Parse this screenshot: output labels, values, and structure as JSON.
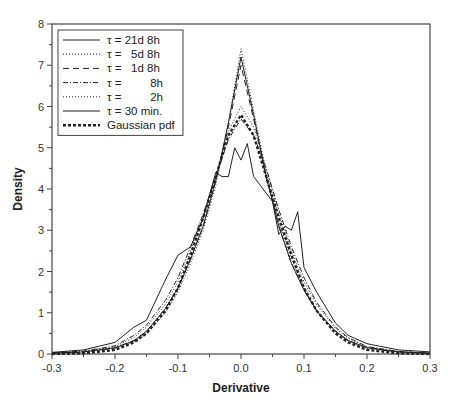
{
  "page_header": "",
  "chart_data": {
    "type": "line",
    "title": "",
    "xlabel": "Derivative",
    "ylabel": "Density",
    "xlim": [
      -0.3,
      0.3
    ],
    "ylim": [
      0,
      8
    ],
    "x_ticks": [
      "-0.3",
      "-0.2",
      "-0.1",
      "0.0",
      "0.1",
      "0.2",
      "0.3"
    ],
    "x_tick_values": [
      -0.3,
      -0.2,
      -0.1,
      0.0,
      0.1,
      0.2,
      0.3
    ],
    "y_ticks": [
      "0",
      "1",
      "2",
      "3",
      "4",
      "5",
      "6",
      "7",
      "8"
    ],
    "y_tick_values": [
      0,
      1,
      2,
      3,
      4,
      5,
      6,
      7,
      8
    ],
    "grid": false,
    "legend_position": "upper-left",
    "series": [
      {
        "name": "τ = 21d 8h",
        "style": "solid",
        "x": [
          -0.3,
          -0.25,
          -0.2,
          -0.17,
          -0.15,
          -0.12,
          -0.1,
          -0.08,
          -0.06,
          -0.04,
          -0.02,
          0.0,
          0.02,
          0.04,
          0.06,
          0.08,
          0.1,
          0.12,
          0.15,
          0.17,
          0.2,
          0.25,
          0.3
        ],
        "y": [
          0.02,
          0.05,
          0.15,
          0.32,
          0.55,
          1.1,
          1.6,
          2.3,
          3.1,
          4.2,
          5.6,
          7.2,
          5.8,
          4.3,
          3.1,
          2.2,
          1.55,
          1.05,
          0.55,
          0.33,
          0.15,
          0.05,
          0.02
        ]
      },
      {
        "name": "τ =   5d 8h",
        "style": "dotted",
        "x": [
          -0.3,
          -0.25,
          -0.2,
          -0.17,
          -0.15,
          -0.12,
          -0.1,
          -0.08,
          -0.06,
          -0.04,
          -0.02,
          0.0,
          0.02,
          0.04,
          0.06,
          0.08,
          0.1,
          0.12,
          0.15,
          0.17,
          0.2,
          0.25,
          0.3
        ],
        "y": [
          0.02,
          0.05,
          0.14,
          0.3,
          0.5,
          1.0,
          1.5,
          2.2,
          3.0,
          4.1,
          5.6,
          7.4,
          5.9,
          4.4,
          3.2,
          2.3,
          1.6,
          1.05,
          0.55,
          0.32,
          0.14,
          0.05,
          0.02
        ]
      },
      {
        "name": "τ =   1d 8h",
        "style": "dashed",
        "x": [
          -0.3,
          -0.25,
          -0.2,
          -0.17,
          -0.15,
          -0.12,
          -0.1,
          -0.08,
          -0.06,
          -0.04,
          -0.02,
          0.0,
          0.02,
          0.04,
          0.06,
          0.08,
          0.1,
          0.12,
          0.15,
          0.17,
          0.2,
          0.25,
          0.3
        ],
        "y": [
          0.02,
          0.05,
          0.15,
          0.33,
          0.55,
          1.1,
          1.6,
          2.3,
          3.1,
          4.2,
          5.5,
          7.0,
          5.7,
          4.3,
          3.1,
          2.2,
          1.55,
          1.05,
          0.55,
          0.33,
          0.15,
          0.05,
          0.02
        ]
      },
      {
        "name": "τ =          8h",
        "style": "dashdot",
        "x": [
          -0.3,
          -0.25,
          -0.2,
          -0.17,
          -0.15,
          -0.12,
          -0.1,
          -0.08,
          -0.06,
          -0.04,
          -0.02,
          0.0,
          0.02,
          0.04,
          0.06,
          0.08,
          0.1,
          0.12,
          0.15,
          0.17,
          0.2,
          0.25,
          0.3
        ],
        "y": [
          0.03,
          0.07,
          0.2,
          0.45,
          0.7,
          1.3,
          1.85,
          2.6,
          3.4,
          4.3,
          5.2,
          5.7,
          5.3,
          4.5,
          3.5,
          2.6,
          1.85,
          1.25,
          0.65,
          0.4,
          0.18,
          0.06,
          0.02
        ]
      },
      {
        "name": "τ =          2h",
        "style": "dotted",
        "x": [
          -0.3,
          -0.25,
          -0.2,
          -0.17,
          -0.15,
          -0.12,
          -0.1,
          -0.08,
          -0.06,
          -0.04,
          -0.02,
          0.0,
          0.02,
          0.04,
          0.06,
          0.08,
          0.1,
          0.12,
          0.15,
          0.17,
          0.2,
          0.25,
          0.3
        ],
        "y": [
          0.03,
          0.06,
          0.18,
          0.4,
          0.65,
          1.2,
          1.75,
          2.5,
          3.3,
          4.3,
          5.4,
          6.0,
          5.5,
          4.5,
          3.4,
          2.5,
          1.75,
          1.2,
          0.62,
          0.38,
          0.17,
          0.06,
          0.02
        ]
      },
      {
        "name": "τ = 30 min.",
        "style": "solid",
        "x": [
          -0.3,
          -0.25,
          -0.2,
          -0.17,
          -0.15,
          -0.12,
          -0.1,
          -0.08,
          -0.06,
          -0.04,
          -0.03,
          -0.02,
          -0.01,
          0.0,
          0.01,
          0.02,
          0.04,
          0.05,
          0.06,
          0.07,
          0.08,
          0.09,
          0.1,
          0.12,
          0.15,
          0.17,
          0.2,
          0.25,
          0.3
        ],
        "y": [
          0.04,
          0.1,
          0.28,
          0.65,
          0.82,
          1.8,
          2.4,
          2.6,
          3.3,
          4.4,
          4.3,
          4.3,
          5.0,
          4.7,
          5.1,
          4.3,
          3.9,
          3.7,
          2.9,
          3.1,
          3.0,
          3.45,
          2.1,
          1.5,
          0.75,
          0.45,
          0.25,
          0.1,
          0.05
        ]
      },
      {
        "name": "Gaussian pdf",
        "style": "bold-dashed",
        "x": [
          -0.3,
          -0.25,
          -0.2,
          -0.17,
          -0.15,
          -0.12,
          -0.1,
          -0.08,
          -0.06,
          -0.04,
          -0.02,
          0.0,
          0.02,
          0.04,
          0.06,
          0.08,
          0.1,
          0.12,
          0.15,
          0.17,
          0.2,
          0.25,
          0.3
        ],
        "y": [
          0.0,
          0.02,
          0.1,
          0.28,
          0.5,
          1.05,
          1.6,
          2.4,
          3.3,
          4.3,
          5.3,
          5.8,
          5.3,
          4.3,
          3.3,
          2.4,
          1.6,
          1.05,
          0.5,
          0.28,
          0.1,
          0.02,
          0.0
        ]
      }
    ]
  },
  "legend": {
    "items": [
      {
        "label": "τ = 21d 8h",
        "dash": "",
        "width": 1
      },
      {
        "label": "τ =   5d 8h",
        "dash": "1,2",
        "width": 1
      },
      {
        "label": "τ =   1d 8h",
        "dash": "6,4",
        "width": 1
      },
      {
        "label": "τ =         8h",
        "dash": "5,2,1,2",
        "width": 1
      },
      {
        "label": "τ =         2h",
        "dash": "1,2",
        "width": 1
      },
      {
        "label": "τ = 30 min.",
        "dash": "",
        "width": 1
      },
      {
        "label": "Gaussian pdf",
        "dash": "3,2",
        "width": 2.4
      }
    ]
  },
  "colors": {
    "line": "#222222",
    "axis": "#444444",
    "background": "#ffffff"
  }
}
